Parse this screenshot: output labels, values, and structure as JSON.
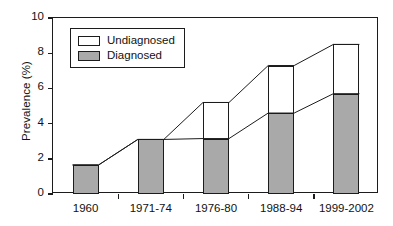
{
  "chart_data": {
    "type": "bar",
    "subtype": "stacked-bar",
    "title": "",
    "xlabel": "",
    "ylabel": "Prevalence (%)",
    "ylim": [
      0,
      10
    ],
    "yticks": [
      0,
      2,
      4,
      6,
      8,
      10
    ],
    "ytick_labels": [
      "0",
      "2",
      "4",
      "6",
      "8",
      "10"
    ],
    "grid": false,
    "legend_position": "upper-left-inside",
    "categories": [
      "1960",
      "1971-74",
      "1976-80",
      "1988-94",
      "1999-2002"
    ],
    "series": [
      {
        "name": "Diagnosed",
        "values": [
          1.65,
          3.1,
          3.15,
          4.6,
          5.7
        ],
        "color": "#a9a9a9"
      },
      {
        "name": "Undiagnosed",
        "values": [
          0.0,
          0.0,
          2.05,
          2.7,
          2.8
        ],
        "color": "#ffffff"
      }
    ],
    "totals": [
      1.65,
      3.1,
      5.2,
      7.3,
      8.5
    ],
    "annotations": [
      "Connector lines join the tops of the Diagnosed segments across categories",
      "Connector lines join the tops of the total (Diagnosed + Undiagnosed) bars across categories"
    ]
  },
  "legend": {
    "entries": [
      {
        "label": "Undiagnosed",
        "swatch": "white-square"
      },
      {
        "label": "Diagnosed",
        "swatch": "gray-square"
      }
    ]
  },
  "axes": {
    "y_title": "Prevalence (%)"
  },
  "style": {
    "axis_color": "#1c1c1c",
    "diagnosed_fill": "#a9a9a9",
    "undiagnosed_fill": "#ffffff",
    "background": "#ffffff"
  }
}
